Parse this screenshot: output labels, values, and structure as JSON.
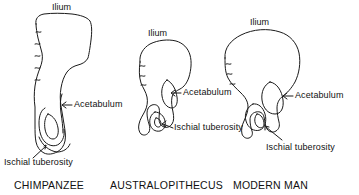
{
  "figure": {
    "type": "diagram",
    "background_color": "#ffffff",
    "line_color": "#1a1a1a"
  },
  "specimens": [
    {
      "id": "chimpanzee",
      "species_label": "CHIMPANZEE",
      "ilium_label": "Ilium",
      "acetabulum_label": "Acetabulum",
      "ischial_tuberosity_label": "Ischial tuberosity"
    },
    {
      "id": "australopithecus",
      "species_label": "AUSTRALOPITHECUS",
      "ilium_label": "Ilium",
      "acetabulum_label": "Acetabulum",
      "ischial_tuberosity_label": "Ischial tuberosity"
    },
    {
      "id": "modern-man",
      "species_label": "MODERN MAN",
      "ilium_label": "Ilium",
      "acetabulum_label": "Acetabulum",
      "ischial_tuberosity_label": "Ischial tuberosity"
    }
  ]
}
